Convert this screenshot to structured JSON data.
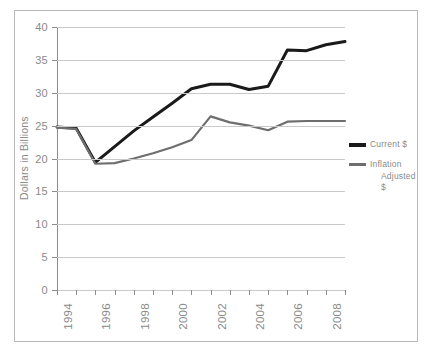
{
  "chart_data": {
    "type": "line",
    "title": "",
    "xlabel": "",
    "ylabel": "Dollars in Billions",
    "ylim": [
      0,
      40
    ],
    "ytick_step": 5,
    "yticks": [
      40,
      35,
      30,
      25,
      20,
      15,
      10,
      5,
      0
    ],
    "xticks": [
      "1994",
      "1996",
      "1998",
      "2000",
      "2002",
      "2004",
      "2006",
      "2008"
    ],
    "x": [
      1994,
      1995,
      1996,
      1997,
      1998,
      1999,
      2000,
      2001,
      2002,
      2003,
      2004,
      2005,
      2006,
      2007,
      2008,
      2009
    ],
    "grid": true,
    "legend_position": "right",
    "series": [
      {
        "name": "Current $",
        "color": "#1a1a1a",
        "values": [
          24.8,
          24.6,
          19.4,
          21.8,
          24.2,
          26.3,
          28.4,
          30.6,
          31.3,
          31.3,
          30.5,
          31.0,
          36.5,
          36.4,
          37.3,
          37.8
        ]
      },
      {
        "name": "Inflation Adjusted $",
        "color": "#6e6e6e",
        "values": [
          24.7,
          24.5,
          19.2,
          19.3,
          20.0,
          20.8,
          21.7,
          22.8,
          26.4,
          25.5,
          25.0,
          24.3,
          25.6,
          25.7,
          25.7,
          25.7
        ]
      }
    ]
  },
  "legend": {
    "items": [
      {
        "label": "Current $",
        "line2": ""
      },
      {
        "label": "Inflation",
        "line2": "Adjusted $"
      }
    ]
  },
  "axes": {
    "y_title": "Dollars in Billions"
  }
}
